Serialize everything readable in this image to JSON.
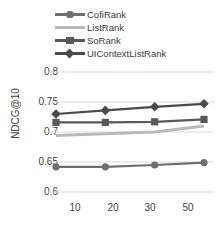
{
  "chart_data": {
    "type": "line",
    "title": "",
    "xlabel": "",
    "ylabel": "NDCG@10",
    "x": [
      10,
      20,
      30,
      50
    ],
    "categories": [
      "10",
      "20",
      "30",
      "50"
    ],
    "xtick_labels": [
      "10",
      "20",
      "30",
      "50"
    ],
    "ytick_labels": [
      "0.8",
      "0.75",
      "0.7",
      "0.65",
      "0.6"
    ],
    "ytick_values": [
      0.8,
      0.75,
      0.7,
      0.65,
      0.6
    ],
    "ylim": [
      0.6,
      0.8
    ],
    "grid": "horizontal",
    "legend_position": "top",
    "series": [
      {
        "name": "CofiRank",
        "marker": "circle",
        "color": "#6e6e6e",
        "values": [
          0.642,
          0.642,
          0.645,
          0.649
        ]
      },
      {
        "name": "ListRank",
        "marker": "none",
        "color": "#b9b9b9",
        "values": [
          0.694,
          0.697,
          0.7,
          0.71
        ]
      },
      {
        "name": "SoRank",
        "marker": "square",
        "color": "#595959",
        "values": [
          0.716,
          0.716,
          0.717,
          0.721
        ]
      },
      {
        "name": "UIContextListRank",
        "marker": "diamond",
        "color": "#4a4a4a",
        "values": [
          0.73,
          0.736,
          0.742,
          0.747
        ]
      }
    ]
  },
  "legend": {
    "items": [
      {
        "label": "CofiRank",
        "marker": "circle",
        "color": "#6e6e6e"
      },
      {
        "label": "ListRank",
        "marker": "none",
        "color": "#b9b9b9"
      },
      {
        "label": "SoRank",
        "marker": "square",
        "color": "#595959"
      },
      {
        "label": "UIContextListRank",
        "marker": "diamond",
        "color": "#4a4a4a"
      }
    ]
  },
  "axes": {
    "y_title": "NDCG@10",
    "y_ticks": [
      "0.8",
      "0.75",
      "0.7",
      "0.65",
      "0.6"
    ],
    "x_ticks": [
      "10",
      "20",
      "30",
      "50"
    ]
  },
  "colors": {
    "grid": "#d9d9d9",
    "text": "#404040",
    "background": "#ffffff"
  }
}
